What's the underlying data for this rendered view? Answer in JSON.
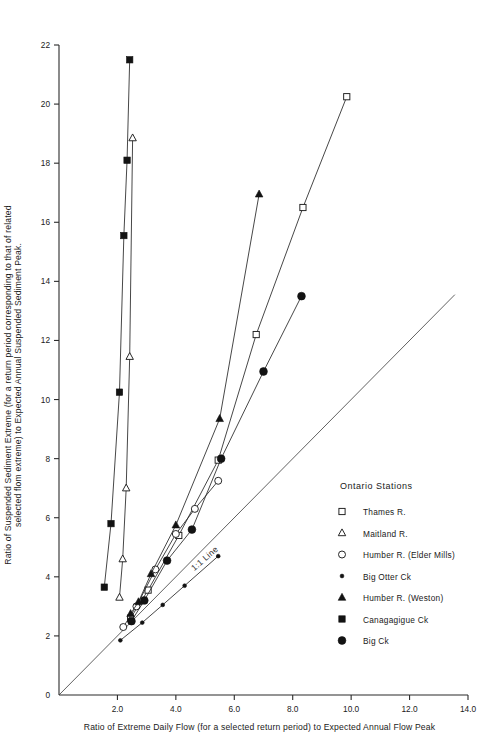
{
  "chart_data": {
    "type": "line",
    "title": "",
    "xlabel": "Ratio of Extreme Daily Flow (for a selected return period) to Expected Annual Flow Peak",
    "ylabel_line1": "Ratio of Suspended Sediment Extreme (for a return period corresponding to that of related",
    "ylabel_line2": "selected flom extreme) to Expected Annual Suspended Sediment Peak.",
    "xlim": [
      0,
      14.0
    ],
    "ylim": [
      0,
      22
    ],
    "xticks": [
      0,
      2.0,
      4.0,
      6.0,
      8.0,
      10.0,
      12.0,
      14.0
    ],
    "xticklabels": [
      "0",
      "2.0",
      "4.0",
      "6.0",
      "8.0",
      "10.0",
      "12.0",
      "14.0"
    ],
    "yticks": [
      0,
      2,
      4,
      6,
      8,
      10,
      12,
      14,
      16,
      18,
      20,
      22
    ],
    "yticklabels": [
      "0",
      "2",
      "4",
      "6",
      "8",
      "10",
      "12",
      "14",
      "16",
      "18",
      "20",
      "22"
    ],
    "grid": false,
    "legend_position": "right-lower",
    "legend_title": "Ontario Stations",
    "annotations": [
      {
        "text": "1:1 Line",
        "x": 5.05,
        "y": 4.55,
        "rotation": -41
      }
    ],
    "reference_line": {
      "name": "1:1 Line",
      "x": [
        0,
        13.55
      ],
      "y": [
        0,
        13.55
      ]
    },
    "series": [
      {
        "name": "Thames R.",
        "marker": "open-square",
        "x": [
          2.45,
          3.05,
          4.1,
          5.45,
          6.75,
          8.35,
          9.85
        ],
        "y": [
          2.6,
          3.55,
          5.4,
          7.95,
          12.2,
          16.5,
          20.25
        ]
      },
      {
        "name": "Maitland R.",
        "marker": "open-triangle",
        "x": [
          2.07,
          2.18,
          2.3,
          2.42,
          2.52
        ],
        "y": [
          3.3,
          4.6,
          7.0,
          11.45,
          18.85
        ]
      },
      {
        "name": "Humber R. (Elder Mills)",
        "marker": "open-circle",
        "x": [
          2.2,
          2.65,
          3.3,
          4.0,
          4.65,
          5.45
        ],
        "y": [
          2.3,
          3.0,
          4.25,
          5.45,
          6.3,
          7.25
        ]
      },
      {
        "name": "Big Otter Ck",
        "marker": "small-filled-circle",
        "x": [
          2.1,
          2.85,
          3.55,
          4.3,
          5.45
        ],
        "y": [
          1.85,
          2.45,
          3.05,
          3.7,
          4.7
        ]
      },
      {
        "name": "Humber R. (Weston)",
        "marker": "filled-triangle",
        "x": [
          2.45,
          2.72,
          3.15,
          4.0,
          5.5,
          6.85
        ],
        "y": [
          2.75,
          3.15,
          4.1,
          5.75,
          9.35,
          16.95
        ]
      },
      {
        "name": "Canagagigue Ck",
        "marker": "filled-square",
        "x": [
          1.55,
          1.78,
          2.07,
          2.22,
          2.33,
          2.42
        ],
        "y": [
          3.65,
          5.8,
          10.25,
          15.55,
          18.1,
          21.5
        ]
      },
      {
        "name": "Big Ck",
        "marker": "large-filled-circle",
        "x": [
          2.48,
          2.92,
          3.7,
          4.55,
          5.55,
          7.0,
          8.3
        ],
        "y": [
          2.5,
          3.2,
          4.55,
          5.6,
          8.0,
          10.95,
          13.5
        ]
      }
    ]
  },
  "legend": {
    "title": "Ontario Stations",
    "items": [
      {
        "label": "Thames R.",
        "marker": "open-square"
      },
      {
        "label": "Maitland R.",
        "marker": "open-triangle"
      },
      {
        "label": "Humber R. (Elder Mills)",
        "marker": "open-circle"
      },
      {
        "label": "Big Otter Ck",
        "marker": "small-filled-circle"
      },
      {
        "label": "Humber R. (Weston)",
        "marker": "filled-triangle"
      },
      {
        "label": "Canagagigue Ck",
        "marker": "filled-square"
      },
      {
        "label": "Big Ck",
        "marker": "large-filled-circle"
      }
    ]
  },
  "colors": {
    "ink": "#1a1a1a",
    "line": "#262626",
    "background": "#ffffff"
  }
}
